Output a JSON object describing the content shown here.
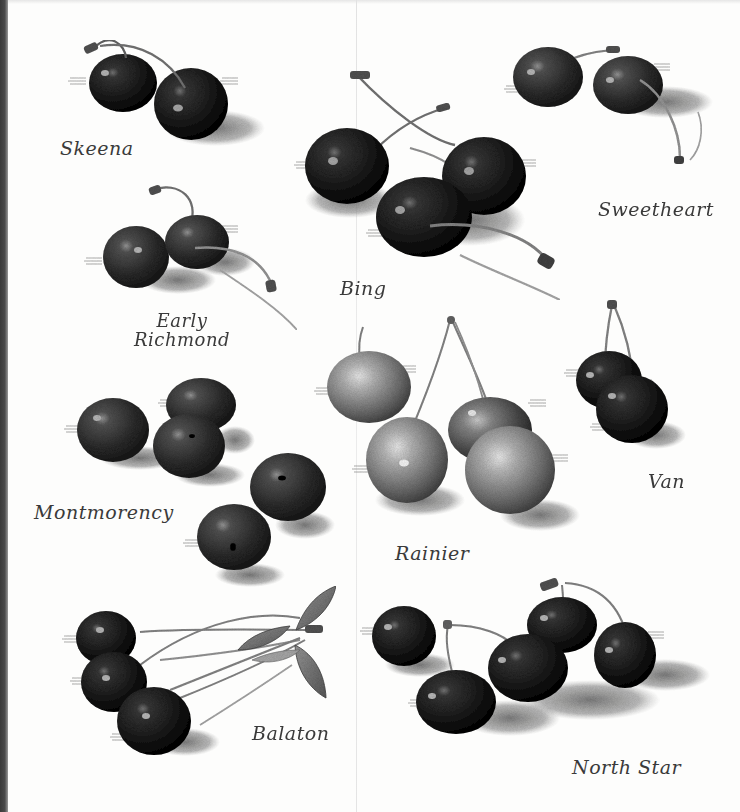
{
  "illustration": {
    "subject": "Cherry varieties",
    "style": "monochrome stipple engraving",
    "colors": {
      "paper": "#fdfdfc",
      "ink_dark": "#1a1a1a",
      "ink_mid": "#555555",
      "ink_light": "#bdbdbd",
      "label_ink": "#3a3a3a"
    }
  },
  "varieties": [
    {
      "id": "skeena",
      "label": "Skeena",
      "cherry_count": 2
    },
    {
      "id": "bing",
      "label": "Bing",
      "cherry_count": 3
    },
    {
      "id": "sweetheart",
      "label": "Sweetheart",
      "cherry_count": 2
    },
    {
      "id": "early-richmond",
      "label_line1": "Early",
      "label_line2": "Richmond",
      "cherry_count": 2
    },
    {
      "id": "montmorency",
      "label": "Montmorency",
      "cherry_count": 5
    },
    {
      "id": "rainier",
      "label": "Rainier",
      "cherry_count": 4
    },
    {
      "id": "van",
      "label": "Van",
      "cherry_count": 2
    },
    {
      "id": "balaton",
      "label": "Balaton",
      "cherry_count": 3
    },
    {
      "id": "north-star",
      "label": "North Star",
      "cherry_count": 5
    }
  ]
}
